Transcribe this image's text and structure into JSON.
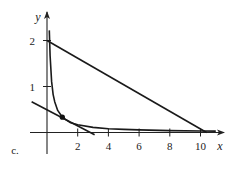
{
  "panel_label": "c.",
  "chart_data": {
    "type": "line",
    "title": "",
    "xlabel": "x",
    "ylabel": "y",
    "xlim": [
      -1.1,
      11.4
    ],
    "ylim": [
      -0.45,
      2.55
    ],
    "x_ticks": [
      2,
      4,
      6,
      8,
      10
    ],
    "x_tick_labels": [
      "2",
      "4",
      "6",
      "8",
      "10"
    ],
    "y_ticks": [
      1,
      2
    ],
    "y_tick_labels": [
      "1",
      "2"
    ],
    "grid": false,
    "legend": null,
    "series": [
      {
        "name": "curve",
        "kind": "function",
        "description": "hyperbola-like curve y = 1/(3x), decreasing, approaching both axes",
        "x": [
          0.15,
          0.2,
          0.3,
          0.4,
          0.5,
          0.7,
          1.0,
          1.5,
          2,
          3,
          4,
          5,
          6,
          8,
          10,
          11
        ],
        "y": [
          2.22,
          1.67,
          1.11,
          0.83,
          0.67,
          0.48,
          0.33,
          0.22,
          0.17,
          0.11,
          0.083,
          0.067,
          0.056,
          0.042,
          0.033,
          0.03
        ]
      },
      {
        "name": "line-through-(0,2)",
        "kind": "segment",
        "x": [
          0,
          10.4
        ],
        "y": [
          2,
          0
        ]
      },
      {
        "name": "tangent-line",
        "kind": "segment",
        "x": [
          -1.0,
          3.1
        ],
        "y": [
          0.667,
          -0.05
        ]
      }
    ],
    "points": [
      {
        "name": "tangent-point",
        "x": 1.0,
        "y": 0.333
      }
    ]
  }
}
